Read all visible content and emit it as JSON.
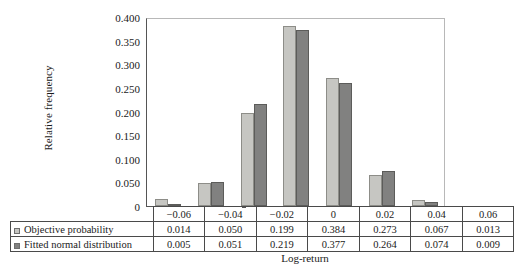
{
  "chart_data": {
    "type": "bar",
    "title": "",
    "xlabel": "Log-return",
    "ylabel": "Relative frequency",
    "categories": [
      "−0.06",
      "−0.04",
      "−0.02",
      "0",
      "0.02",
      "0.04",
      "0.06"
    ],
    "series": [
      {
        "name": "Objective probability",
        "color": "#c6c6c2",
        "values": [
          0.014,
          0.05,
          0.199,
          0.384,
          0.273,
          0.067,
          0.013
        ],
        "labels": [
          "0.014",
          "0.050",
          "0.199",
          "0.384",
          "0.273",
          "0.067",
          "0.013"
        ]
      },
      {
        "name": "Fitted normal distribution",
        "color": "#818180",
        "values": [
          0.005,
          0.051,
          0.219,
          0.377,
          0.264,
          0.074,
          0.009
        ],
        "labels": [
          "0.005",
          "0.051",
          "0.219",
          "0.377",
          "0.264",
          "0.074",
          "0.009"
        ]
      }
    ],
    "ylim": [
      0,
      0.4
    ],
    "ytick_values": [
      0.4,
      0.35,
      0.3,
      0.25,
      0.2,
      0.15,
      0.1,
      0.05,
      0
    ],
    "ytick_labels": [
      "0.400",
      "0.350",
      "0.300",
      "0.250",
      "0.200",
      "0.150",
      "0.100",
      "0.050",
      "0"
    ],
    "grid": false,
    "legend_position": "table-rowheads"
  }
}
